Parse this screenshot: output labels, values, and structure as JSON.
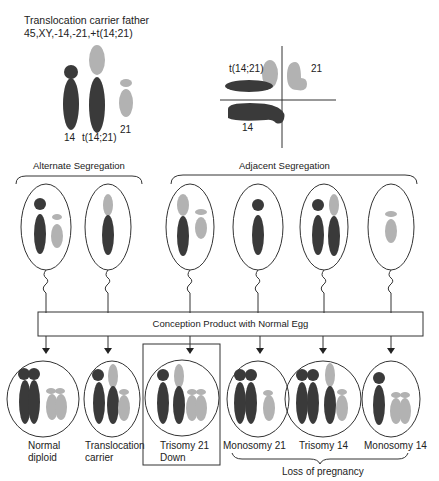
{
  "header": {
    "title": "Translocation carrier father",
    "karyotype": "45,XY,-14,-21,+t(14;21)"
  },
  "father_chromosomes": {
    "labels": [
      "14",
      "t(14;21)",
      "21"
    ]
  },
  "pairing_cross": {
    "labels": [
      "t(14;21)",
      "21",
      "14"
    ]
  },
  "segregation": {
    "alternate_label": "Alternate Segregation",
    "adjacent_label": "Adjacent Segregation"
  },
  "conception_box": {
    "label": "Conception Product with Normal Egg"
  },
  "outcomes": [
    {
      "line1": "Normal",
      "line2": "diploid"
    },
    {
      "line1": "Translocation",
      "line2": "carrier"
    },
    {
      "line1": "Trisomy 21",
      "line2": "Down",
      "highlighted": true
    },
    {
      "line1": "Monosomy 21",
      "line2": ""
    },
    {
      "line1": "Trisomy 14",
      "line2": ""
    },
    {
      "line1": "Monosomy 14",
      "line2": ""
    }
  ],
  "loss_label": "Loss of pregnancy",
  "colors": {
    "chromosome_14": "#3a3a3a",
    "chromosome_21": "#b2b2b2",
    "line": "#333333"
  }
}
